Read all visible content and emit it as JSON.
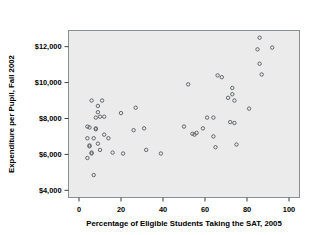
{
  "chart_data": {
    "type": "scatter",
    "title": "",
    "xlabel": "Percentage of Eligible Students Taking the SAT, 2005",
    "ylabel": "Expenditure per Pupil, Fall 2002",
    "xlim": [
      -5,
      105
    ],
    "ylim": [
      3600,
      12900
    ],
    "xticks": [
      0,
      20,
      40,
      60,
      80,
      100
    ],
    "xtick_labels": [
      "0",
      "20",
      "40",
      "60",
      "80",
      "100"
    ],
    "yticks": [
      4000,
      6000,
      8000,
      10000,
      12000
    ],
    "ytick_labels": [
      "$4,000",
      "$6,000",
      "$8,000",
      "$10,000",
      "$12,000"
    ],
    "grid": false,
    "legend": null,
    "marker": {
      "shape": "circle-open",
      "size": 3.1,
      "color": "#555a5e"
    },
    "plot_background": "#ebebeb",
    "points": [
      [
        4,
        5800
      ],
      [
        4,
        6900
      ],
      [
        4,
        7550
      ],
      [
        5,
        7500
      ],
      [
        5,
        6500
      ],
      [
        5,
        6450
      ],
      [
        6,
        9000
      ],
      [
        6,
        6100
      ],
      [
        6,
        6050
      ],
      [
        7,
        4850
      ],
      [
        7,
        6900
      ],
      [
        8,
        8050
      ],
      [
        8,
        7450
      ],
      [
        8,
        7400
      ],
      [
        9,
        8700
      ],
      [
        9,
        8350
      ],
      [
        9,
        6600
      ],
      [
        10,
        8100
      ],
      [
        10,
        6250
      ],
      [
        11,
        9000
      ],
      [
        12,
        8100
      ],
      [
        12,
        7100
      ],
      [
        14,
        6900
      ],
      [
        16,
        6100
      ],
      [
        20,
        8300
      ],
      [
        21,
        6050
      ],
      [
        26,
        7350
      ],
      [
        27,
        8600
      ],
      [
        31,
        7450
      ],
      [
        32,
        6250
      ],
      [
        39,
        6050
      ],
      [
        50,
        7550
      ],
      [
        52,
        9900
      ],
      [
        54,
        7150
      ],
      [
        55,
        7100
      ],
      [
        56,
        7200
      ],
      [
        59,
        7450
      ],
      [
        61,
        8050
      ],
      [
        64,
        8050
      ],
      [
        64,
        7000
      ],
      [
        65,
        6400
      ],
      [
        66,
        10400
      ],
      [
        68,
        10300
      ],
      [
        71,
        9150
      ],
      [
        72,
        7800
      ],
      [
        73,
        9700
      ],
      [
        73,
        9350
      ],
      [
        74,
        9000
      ],
      [
        74,
        7750
      ],
      [
        75,
        6550
      ],
      [
        81,
        8550
      ],
      [
        85,
        11850
      ],
      [
        86,
        12500
      ],
      [
        86,
        11050
      ],
      [
        87,
        10450
      ],
      [
        92,
        11950
      ]
    ]
  }
}
